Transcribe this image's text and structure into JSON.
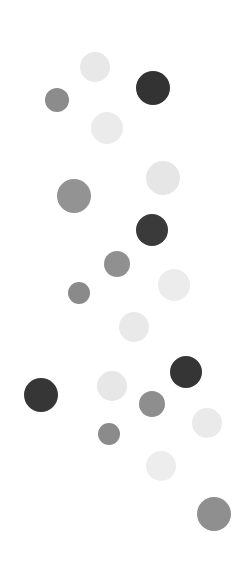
{
  "figure": {
    "title": "",
    "background_color": "#ffffff",
    "width": 239,
    "height": 572
  },
  "chart_data": {
    "type": "scatter",
    "title": "",
    "subtitle": "",
    "xlabel": "",
    "ylabel": "",
    "xlim": [
      0,
      239
    ],
    "ylim": [
      0,
      572
    ],
    "grid": false,
    "legend": null,
    "axes_visible": false,
    "tick_labels": {
      "x": [],
      "y": []
    },
    "annotations": [],
    "marker": "circle",
    "encoding": {
      "x": "x position (px)",
      "y": "y position (px)",
      "size": "marker radius (px)",
      "color": "grayscale fill"
    },
    "color_groups": [
      {
        "name": "light-gray",
        "color": "#e9e9e9",
        "count": 8
      },
      {
        "name": "medium-gray",
        "color": "#8e8e8e",
        "count": 7
      },
      {
        "name": "dark-gray",
        "color": "#353535",
        "count": 4
      }
    ],
    "points": [
      {
        "id": "dot-01",
        "x": 95,
        "y": 67,
        "r": 15,
        "color": "#e8e8e8",
        "group": "light-gray"
      },
      {
        "id": "dot-02",
        "x": 57,
        "y": 100,
        "r": 12,
        "color": "#8c8c8c",
        "group": "medium-gray"
      },
      {
        "id": "dot-03",
        "x": 153,
        "y": 88,
        "r": 17,
        "color": "#333333",
        "group": "dark-gray"
      },
      {
        "id": "dot-04",
        "x": 107,
        "y": 128,
        "r": 16,
        "color": "#ebebeb",
        "group": "light-gray"
      },
      {
        "id": "dot-05",
        "x": 163,
        "y": 178,
        "r": 17,
        "color": "#e6e6e6",
        "group": "light-gray"
      },
      {
        "id": "dot-06",
        "x": 74,
        "y": 196,
        "r": 17,
        "color": "#939393",
        "group": "medium-gray"
      },
      {
        "id": "dot-07",
        "x": 152,
        "y": 230,
        "r": 16,
        "color": "#3a3a3a",
        "group": "dark-gray"
      },
      {
        "id": "dot-08",
        "x": 117,
        "y": 264,
        "r": 13,
        "color": "#909090",
        "group": "medium-gray"
      },
      {
        "id": "dot-09",
        "x": 174,
        "y": 285,
        "r": 16,
        "color": "#ececec",
        "group": "light-gray"
      },
      {
        "id": "dot-10",
        "x": 79,
        "y": 293,
        "r": 11,
        "color": "#8a8a8a",
        "group": "medium-gray"
      },
      {
        "id": "dot-11",
        "x": 134,
        "y": 327,
        "r": 15,
        "color": "#e9e9e9",
        "group": "light-gray"
      },
      {
        "id": "dot-12",
        "x": 186,
        "y": 372,
        "r": 16,
        "color": "#353535",
        "group": "dark-gray"
      },
      {
        "id": "dot-13",
        "x": 41,
        "y": 395,
        "r": 17,
        "color": "#363636",
        "group": "dark-gray"
      },
      {
        "id": "dot-14",
        "x": 112,
        "y": 386,
        "r": 15,
        "color": "#e7e7e7",
        "group": "light-gray"
      },
      {
        "id": "dot-15",
        "x": 152,
        "y": 404,
        "r": 13,
        "color": "#8e8e8e",
        "group": "medium-gray"
      },
      {
        "id": "dot-16",
        "x": 109,
        "y": 434,
        "r": 11,
        "color": "#8b8b8b",
        "group": "medium-gray"
      },
      {
        "id": "dot-17",
        "x": 207,
        "y": 423,
        "r": 15,
        "color": "#eaeaea",
        "group": "light-gray"
      },
      {
        "id": "dot-18",
        "x": 161,
        "y": 466,
        "r": 15,
        "color": "#ededed",
        "group": "light-gray"
      },
      {
        "id": "dot-19",
        "x": 214,
        "y": 514,
        "r": 17,
        "color": "#8f8f8f",
        "group": "medium-gray"
      }
    ]
  }
}
